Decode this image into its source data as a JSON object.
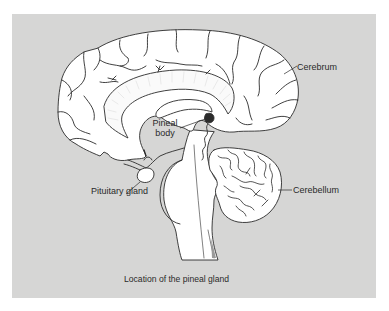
{
  "figure": {
    "caption": "Location of the pineal gland",
    "colors": {
      "background": "#d6d6d5",
      "page": "#ffffff",
      "tissue": "#ffffff",
      "outline": "#2b2b2b"
    },
    "labels": {
      "cerebrum": "Cerebrum",
      "pineal_line1": "Pineal",
      "pineal_line2": "body",
      "pituitary": "Pituitary gland",
      "cerebellum": "Cerebellum"
    }
  }
}
